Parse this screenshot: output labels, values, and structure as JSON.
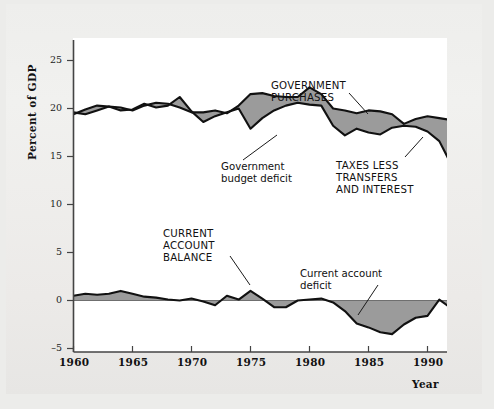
{
  "figure": {
    "background_color": "#ececea",
    "plot_background_color": "#ffffff",
    "band_fill_color": "#9b9b9b",
    "line_color": "#111111"
  },
  "axes": {
    "y_axis_title": "Percent of GDP",
    "y_ticks": [
      "25",
      "20",
      "15",
      "10",
      "5",
      "0",
      "–5"
    ],
    "y_values": [
      25,
      20,
      15,
      10,
      5,
      0,
      -5
    ],
    "x_ticks": [
      "1960",
      "1965",
      "1970",
      "1975",
      "1980",
      "1985",
      "1990"
    ],
    "x_values": [
      1960,
      1965,
      1970,
      1975,
      1980,
      1985,
      1990
    ],
    "x_axis_title": "Year"
  },
  "annotations": {
    "government_purchases": "GOVERNMENT\nPURCHASES",
    "government_budget_deficit": "Government\nbudget deficit",
    "taxes_less_transfers_and_interest": "TAXES LESS\nTRANSFERS\nAND INTEREST",
    "current_account_balance": "CURRENT\nACCOUNT\nBALANCE",
    "current_account_deficit": "Current account\ndeficit"
  },
  "chart_data": {
    "type": "area",
    "title": "",
    "xlabel": "Year",
    "ylabel": "Percent of GDP",
    "xlim": [
      1960,
      1992
    ],
    "ylim": [
      -5,
      26
    ],
    "grid": false,
    "legend": "annotations-inline",
    "x": [
      1960,
      1961,
      1962,
      1963,
      1964,
      1965,
      1966,
      1967,
      1968,
      1969,
      1970,
      1971,
      1972,
      1973,
      1974,
      1975,
      1976,
      1977,
      1978,
      1979,
      1980,
      1981,
      1982,
      1983,
      1984,
      1985,
      1986,
      1987,
      1988,
      1989,
      1990,
      1991,
      1992
    ],
    "series": [
      {
        "name": "GOVERNMENT PURCHASES",
        "values": [
          19.4,
          19.9,
          20.3,
          20.2,
          20.1,
          19.8,
          20.3,
          20.6,
          20.5,
          20.1,
          19.6,
          19.6,
          19.8,
          19.5,
          20.3,
          21.5,
          21.6,
          21.3,
          21.2,
          21.2,
          22.2,
          21.5,
          20.0,
          19.8,
          19.5,
          19.8,
          19.7,
          19.4,
          18.4,
          18.9,
          19.2,
          19.0,
          18.8
        ]
      },
      {
        "name": "TAXES LESS TRANSFERS AND INTEREST",
        "values": [
          19.6,
          19.4,
          19.8,
          20.2,
          19.8,
          19.9,
          20.5,
          20.1,
          20.3,
          21.2,
          19.7,
          18.6,
          19.2,
          19.6,
          20.0,
          17.9,
          19.0,
          19.8,
          20.3,
          20.6,
          20.4,
          20.3,
          18.2,
          17.2,
          17.9,
          17.5,
          17.3,
          18.0,
          18.2,
          18.1,
          17.6,
          16.6,
          14.2
        ]
      },
      {
        "name": "CURRENT ACCOUNT BALANCE",
        "values": [
          0.5,
          0.7,
          0.6,
          0.7,
          1.0,
          0.7,
          0.4,
          0.3,
          0.1,
          0.0,
          0.2,
          -0.1,
          -0.5,
          0.5,
          0.1,
          1.0,
          0.2,
          -0.7,
          -0.7,
          0.0,
          0.1,
          0.2,
          -0.2,
          -1.1,
          -2.4,
          -2.8,
          -3.3,
          -3.5,
          -2.5,
          -1.8,
          -1.6,
          0.1,
          -0.8
        ]
      }
    ],
    "notes": [
      "Shaded region between GOVERNMENT PURCHASES and TAXES LESS TRANSFERS AND INTEREST is the government budget deficit.",
      "Shaded region between CURRENT ACCOUNT BALANCE and the zero line is the current account deficit."
    ]
  }
}
